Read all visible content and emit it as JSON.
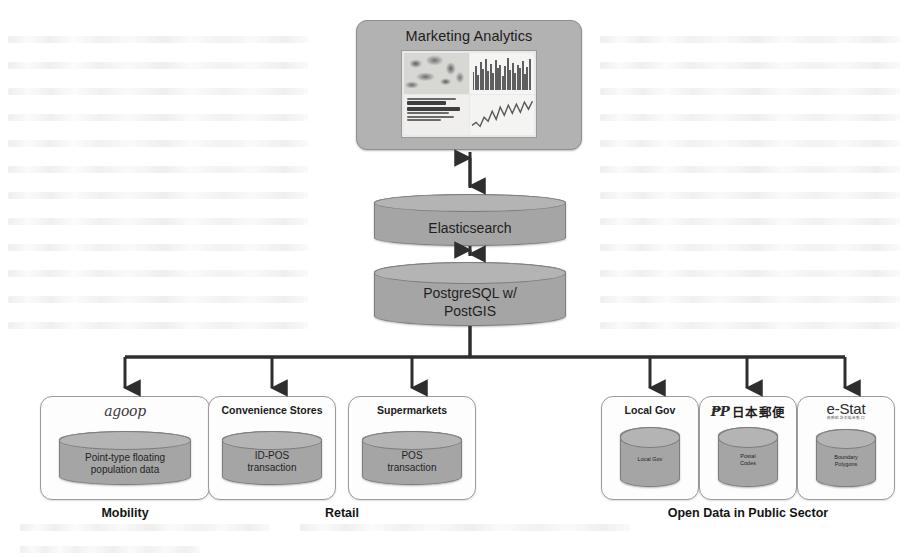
{
  "diagram": {
    "colors": {
      "node_fill": "#b2b2b2",
      "cylinder_fill": "#a5a5a5",
      "cylinder_top": "#b4b4b4",
      "box_fill": "#fdfdfd",
      "box_border": "#9b9b9b",
      "connector": "#2e2e2e",
      "text": "#1b1b1b",
      "background": "#ffffff"
    }
  },
  "analytics": {
    "title": "Marketing Analytics",
    "thumbnail": {
      "panels": [
        "map-heatmap",
        "bar-chart",
        "japanese-text-report",
        "line-chart"
      ]
    }
  },
  "stores": [
    {
      "id": "elasticsearch",
      "label": "Elasticsearch",
      "shape": "cylinder"
    },
    {
      "id": "postgresql",
      "label": "PostgreSQL w/\nPostGIS",
      "line1": "PostgreSQL w/",
      "line2": "PostGIS",
      "shape": "cylinder"
    }
  ],
  "sources": [
    {
      "id": "agoop",
      "header": "",
      "logo": "agoop",
      "logo_text": "agoop",
      "data_line1": "Point-type floating",
      "data_line2": "population data"
    },
    {
      "id": "convenience-stores",
      "header": "Convenience Stores",
      "logo": "",
      "data_line1": "ID-POS",
      "data_line2": "transaction"
    },
    {
      "id": "supermarkets",
      "header": "Supermarkets",
      "logo": "",
      "data_line1": "POS",
      "data_line2": "transaction"
    },
    {
      "id": "local-gov",
      "header": "Local Gov",
      "logo": "",
      "data_line1": "Local Gov",
      "data_line2": ""
    },
    {
      "id": "japan-post",
      "header": "",
      "logo": "japan-post",
      "logo_mark": "₱P",
      "logo_text": "日本郵便",
      "data_line1": "Postal",
      "data_line2": "Codes"
    },
    {
      "id": "e-stat",
      "header": "",
      "logo": "e-stat",
      "logo_text": "e-Stat",
      "logo_sub": "政府統計の総合窓口",
      "data_line1": "Boundary",
      "data_line2": "Polygons"
    }
  ],
  "groups": [
    {
      "id": "mobility",
      "caption": "Mobility"
    },
    {
      "id": "retail",
      "caption": "Retail"
    },
    {
      "id": "open-data",
      "caption": "Open Data in Public Sector"
    }
  ]
}
